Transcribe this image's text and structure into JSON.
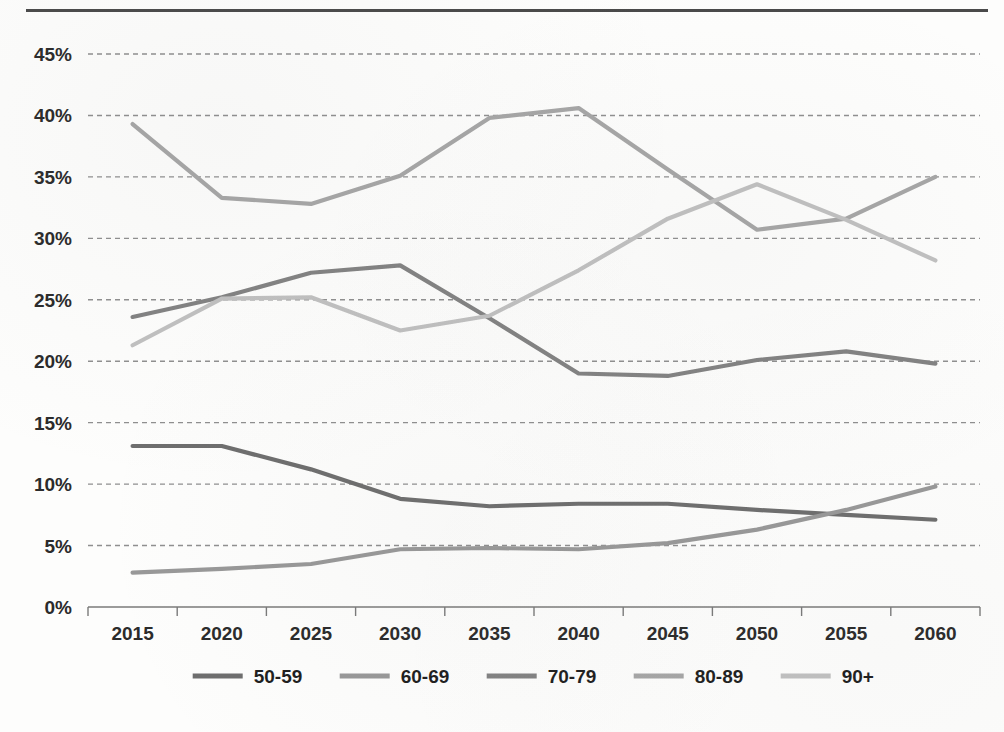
{
  "chart_data": {
    "type": "line",
    "title": "",
    "subtitle": "",
    "xlabel": "",
    "ylabel": "",
    "categories": [
      "2015",
      "2020",
      "2025",
      "2030",
      "2035",
      "2040",
      "2045",
      "2050",
      "2055",
      "2060"
    ],
    "x": [
      2015,
      2020,
      2025,
      2030,
      2035,
      2040,
      2045,
      2050,
      2055,
      2060
    ],
    "ylim": [
      0,
      45
    ],
    "ytick_labels": [
      "0%",
      "5%",
      "10%",
      "15%",
      "20%",
      "25%",
      "30%",
      "35%",
      "40%",
      "45%"
    ],
    "ytick_values": [
      0,
      5,
      10,
      15,
      20,
      25,
      30,
      35,
      40,
      45
    ],
    "grid": true,
    "grid_style": "dashed-horizontal",
    "legend_position": "bottom",
    "value_format": "percent",
    "series": [
      {
        "name": "50-59",
        "color": "#6e6e6e",
        "values": [
          13.1,
          13.1,
          11.2,
          8.8,
          8.2,
          8.4,
          8.4,
          7.9,
          7.5,
          7.1
        ]
      },
      {
        "name": "60-69",
        "color": "#989898",
        "values": [
          2.8,
          3.1,
          3.5,
          4.7,
          4.8,
          4.7,
          5.2,
          6.3,
          7.9,
          9.8
        ]
      },
      {
        "name": "70-79",
        "color": "#828282",
        "values": [
          23.6,
          25.2,
          27.2,
          27.8,
          23.5,
          19.0,
          18.8,
          20.1,
          20.8,
          19.8
        ]
      },
      {
        "name": "80-89",
        "color": "#a6a6a6",
        "values": [
          39.3,
          33.3,
          32.8,
          35.1,
          39.8,
          40.6,
          35.6,
          30.7,
          31.6,
          35.0
        ]
      },
      {
        "name": "90+",
        "color": "#c0c0c0",
        "values": [
          21.3,
          25.1,
          25.2,
          22.5,
          23.7,
          27.4,
          31.6,
          34.4,
          31.5,
          28.2
        ]
      }
    ]
  },
  "axis": {
    "y_axis_name": "percent-axis",
    "x_axis_name": "year-axis",
    "axis_line_color": "#7a7a7a",
    "gridline_color": "#8f8f8f"
  },
  "legend": {
    "items": [
      {
        "label": "50-59",
        "color": "#6e6e6e"
      },
      {
        "label": "60-69",
        "color": "#989898"
      },
      {
        "label": "70-79",
        "color": "#828282"
      },
      {
        "label": "80-89",
        "color": "#a6a6a6"
      },
      {
        "label": "90+",
        "color": "#c0c0c0"
      }
    ]
  },
  "page": {
    "top_rule_color": "#4a4a4a",
    "background": "#fdfdfc"
  }
}
